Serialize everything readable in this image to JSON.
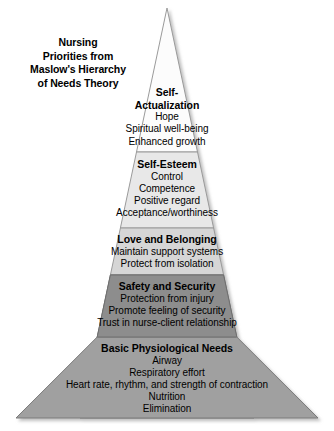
{
  "title": {
    "lines": [
      "Nursing",
      "Priorities from",
      "Maslow's Hierarchy",
      "of Needs Theory"
    ]
  },
  "colors": {
    "apex_fill": "#fcfcfc",
    "esteem_fill": "#e8e8e8",
    "love_fill": "#d6d6d6",
    "safety_fill": "#8d8d8d",
    "basic_fill": "#a0a0a0",
    "outline": "#9a9a9a",
    "divider": "#7a7a7a",
    "text": "#000000",
    "background": "#ffffff"
  },
  "pyramid": {
    "tiers": [
      {
        "id": "self-actualization",
        "heading_lines": [
          "Self-",
          "Actualization"
        ],
        "heading": "Self-Actualization",
        "items": [
          "Hope",
          "Spiritual well-being",
          "Enhanced growth"
        ]
      },
      {
        "id": "self-esteem",
        "heading_lines": [
          "Self-Esteem"
        ],
        "heading": "Self-Esteem",
        "items": [
          "Control",
          "Competence",
          "Positive regard",
          "Acceptance/worthiness"
        ]
      },
      {
        "id": "love-and-belonging",
        "heading_lines": [
          "Love and Belonging"
        ],
        "heading": "Love and Belonging",
        "items": [
          "Maintain support systems",
          "Protect from isolation"
        ]
      },
      {
        "id": "safety-and-security",
        "heading_lines": [
          "Safety and Security"
        ],
        "heading": "Safety and Security",
        "items": [
          "Protection from injury",
          "Promote feeling of security",
          "Trust in nurse-client relationship"
        ]
      },
      {
        "id": "basic-physiological-needs",
        "heading_lines": [
          "Basic Physiological Needs"
        ],
        "heading": "Basic Physiological Needs",
        "items": [
          "Airway",
          "Respiratory effort",
          "Heart rate, rhythm, and strength of contraction",
          "Nutrition",
          "Elimination"
        ]
      }
    ]
  }
}
